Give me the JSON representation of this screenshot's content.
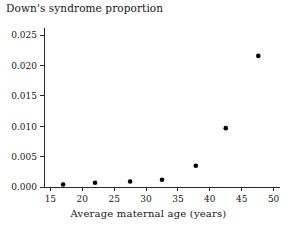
{
  "chart_data": {
    "type": "scatter",
    "title": "Down's syndrome proportion",
    "xlabel": "Average maternal age (years)",
    "ylabel": "",
    "xlim": [
      14,
      51
    ],
    "ylim": [
      0.0,
      0.0262
    ],
    "grid": false,
    "legend": null,
    "x_ticks": [
      15,
      20,
      25,
      30,
      35,
      40,
      45,
      50
    ],
    "x_tick_labels": [
      "15",
      "20",
      "25",
      "30",
      "35",
      "40",
      "45",
      "50"
    ],
    "y_ticks": [
      0.0,
      0.005,
      0.01,
      0.015,
      0.02,
      0.025
    ],
    "y_tick_labels": [
      "0.000",
      "0.005",
      "0.010",
      "0.015",
      "0.020",
      "0.025"
    ],
    "marker": "filled-circle",
    "marker_color": "#000000",
    "x": [
      17.0,
      22.0,
      27.5,
      32.5,
      37.8,
      42.5,
      47.6
    ],
    "y": [
      0.0004,
      0.0007,
      0.0009,
      0.0012,
      0.0035,
      0.0097,
      0.0216
    ],
    "points": [
      {
        "x": 17.0,
        "y": 0.0004
      },
      {
        "x": 22.0,
        "y": 0.0007
      },
      {
        "x": 27.5,
        "y": 0.0009
      },
      {
        "x": 32.5,
        "y": 0.0012
      },
      {
        "x": 37.8,
        "y": 0.0035
      },
      {
        "x": 42.5,
        "y": 0.0097
      },
      {
        "x": 47.6,
        "y": 0.0216
      }
    ]
  },
  "figure": {
    "background_color": "#ffffff",
    "axis_color": "#2b2b2b"
  }
}
